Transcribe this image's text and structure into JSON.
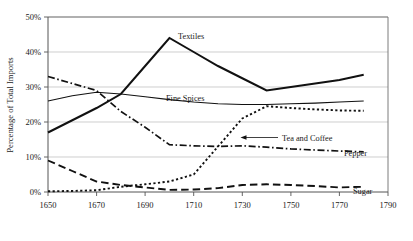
{
  "chart_data": {
    "type": "line",
    "title": "",
    "subtitle": "",
    "xlabel": "",
    "ylabel": "Percentage of Total Imports",
    "xlim": [
      1650,
      1790
    ],
    "ylim": [
      0,
      50
    ],
    "grid": true,
    "legend_position": "inline-labels",
    "x_ticks": [
      "1650",
      "1670",
      "1690",
      "1710",
      "1730",
      "1750",
      "1770",
      "1790"
    ],
    "y_ticks": [
      "0%",
      "10%",
      "20%",
      "30%",
      "40%",
      "50%"
    ],
    "x": [
      1650,
      1660,
      1670,
      1680,
      1690,
      1700,
      1710,
      1720,
      1730,
      1740,
      1750,
      1760,
      1770,
      1780
    ],
    "series": [
      {
        "name": "Textiles",
        "style": "solid-bold",
        "label": "Textiles",
        "values": [
          17.0,
          20.5,
          24.0,
          28.0,
          36.0,
          44.0,
          40.0,
          36.0,
          32.5,
          29.0,
          30.0,
          31.0,
          32.0,
          33.5
        ]
      },
      {
        "name": "Fine Spices",
        "style": "solid-thin",
        "label": "Fine Spices",
        "values": [
          26.0,
          27.5,
          28.5,
          28.0,
          27.2,
          26.4,
          25.7,
          25.2,
          25.0,
          25.0,
          25.2,
          25.4,
          25.7,
          26.0
        ]
      },
      {
        "name": "Pepper",
        "style": "dash-dot",
        "label": "Pepper",
        "values": [
          33.0,
          31.0,
          29.0,
          23.0,
          18.5,
          13.5,
          13.2,
          13.0,
          13.2,
          12.8,
          12.3,
          12.0,
          11.7,
          11.5
        ]
      },
      {
        "name": "Tea and Coffee",
        "style": "dotted",
        "label": "Tea and Coffee",
        "values": [
          0.2,
          0.3,
          0.5,
          1.5,
          2.2,
          3.0,
          5.0,
          13.0,
          21.0,
          24.5,
          24.0,
          23.6,
          23.3,
          23.2
        ]
      },
      {
        "name": "Sugar",
        "style": "dashed-long",
        "label": "Sugar",
        "values": [
          9.0,
          6.0,
          3.0,
          2.0,
          1.3,
          0.6,
          0.7,
          1.1,
          2.0,
          2.2,
          2.0,
          1.7,
          1.3,
          1.5
        ]
      }
    ],
    "annotations": [
      {
        "text": "Tea and Coffee",
        "target_series": "Tea and Coffee",
        "arrow": "left"
      }
    ]
  },
  "labels": {
    "textiles": "Textiles",
    "fine_spices": "Fine Spices",
    "pepper": "Pepper",
    "sugar": "Sugar",
    "tea_and_coffee": "Tea and Coffee",
    "y_axis_title": "Percentage of Total Imports"
  },
  "y_ticks": {
    "t0": "0%",
    "t1": "10%",
    "t2": "20%",
    "t3": "30%",
    "t4": "40%",
    "t5": "50%"
  },
  "x_ticks": {
    "t0": "1650",
    "t1": "1670",
    "t2": "1690",
    "t3": "1710",
    "t4": "1730",
    "t5": "1750",
    "t6": "1770",
    "t7": "1790"
  },
  "colors": {
    "line": "#111111",
    "grid": "#b9b9b9",
    "frame": "#6e6e6e",
    "background": "#ffffff",
    "text": "#1a1a1a"
  }
}
